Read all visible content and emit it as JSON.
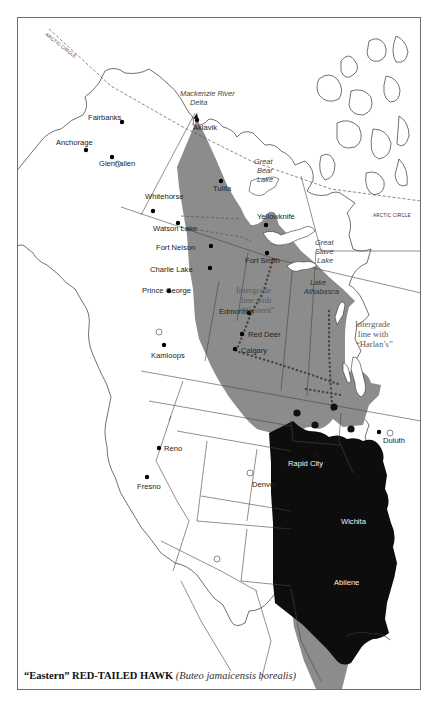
{
  "caption": {
    "common_name": "“Eastern” RED-TAILED HAWK",
    "scientific_name": "(Buteo jamaicensis borealis)"
  },
  "colors": {
    "breeding_range": "#8c8c8c",
    "year_round_range": "#0d0d0d",
    "land": "#ffffff",
    "frame": "#6e6e6e"
  },
  "labels": {
    "arctic_circle_nw": "ARCTIC CIRCLE",
    "arctic_circle_e": "ARCTIC CIRCLE",
    "mackenzie_1": "Mackenzie River",
    "mackenzie_2": "Delta",
    "great_bear_1": "Great",
    "great_bear_2": "Bear",
    "great_bear_3": "Lake",
    "great_slave_1": "Great",
    "great_slave_2": "Slave",
    "great_slave_3": "Lake",
    "athabasca_1": "Lake",
    "athabasca_2": "Athabasca",
    "western_1": "Intergrade",
    "western_2": "line with",
    "western_3": "“Western”",
    "harlans_1": "Intergrade",
    "harlans_2": "line with",
    "harlans_3": "“Harlan’s”"
  },
  "cities": [
    {
      "name": "Fairbanks",
      "x": 121,
      "y": 121,
      "lx": 87,
      "ly": 119
    },
    {
      "name": "Anchorage",
      "x": 85,
      "y": 149,
      "lx": 55,
      "ly": 144
    },
    {
      "name": "Glennallen",
      "x": 111,
      "y": 156,
      "lx": 98,
      "ly": 165
    },
    {
      "name": "Aklavik",
      "x": 196,
      "y": 119,
      "lx": 192,
      "ly": 129
    },
    {
      "name": "Tulita",
      "x": 220,
      "y": 180,
      "lx": 212,
      "ly": 190
    },
    {
      "name": "Whitehorse",
      "x": 152,
      "y": 210,
      "lx": 144,
      "ly": 198
    },
    {
      "name": "Watson Lake",
      "x": 177,
      "y": 222,
      "lx": 152,
      "ly": 230
    },
    {
      "name": "Yellowknife",
      "x": 265,
      "y": 224,
      "lx": 256,
      "ly": 218
    },
    {
      "name": "Fort Nelson",
      "x": 210,
      "y": 245,
      "lx": 155,
      "ly": 249
    },
    {
      "name": "Fort Smith",
      "x": 266,
      "y": 252,
      "lx": 244,
      "ly": 262
    },
    {
      "name": "Charlie Lake",
      "x": 209,
      "y": 267,
      "lx": 149,
      "ly": 271
    },
    {
      "name": "Prince George",
      "x": 168,
      "y": 290,
      "lx": 141,
      "ly": 292
    },
    {
      "name": "Edmonton",
      "x": 248,
      "y": 312,
      "lx": 218,
      "ly": 313
    },
    {
      "name": "Red Deer",
      "x": 241,
      "y": 333,
      "lx": 247,
      "ly": 336
    },
    {
      "name": "Calgary",
      "x": 234,
      "y": 348,
      "lx": 240,
      "ly": 352
    },
    {
      "name": "Kamloops",
      "x": 163,
      "y": 344,
      "lx": 150,
      "ly": 357
    },
    {
      "name": "Duluth",
      "x": 378,
      "y": 431,
      "lx": 382,
      "ly": 442
    },
    {
      "name": "Reno",
      "x": 158,
      "y": 447,
      "lx": 163,
      "ly": 450
    },
    {
      "name": "Fresno",
      "x": 146,
      "y": 476,
      "lx": 136,
      "ly": 488
    },
    {
      "name": "Denver",
      "x": 0,
      "y": 0,
      "lx": 251,
      "ly": 486,
      "no_dot": true
    },
    {
      "name": "Rapid City",
      "x": 0,
      "y": 0,
      "lx": 287,
      "ly": 465,
      "no_dot": true,
      "white": true
    },
    {
      "name": "Wichita",
      "x": 0,
      "y": 0,
      "lx": 340,
      "ly": 523,
      "no_dot": true,
      "white": true
    },
    {
      "name": "Abilene",
      "x": 0,
      "y": 0,
      "lx": 333,
      "ly": 584,
      "no_dot": true,
      "white": true
    }
  ],
  "large_dots": [
    {
      "x": 296,
      "y": 412
    },
    {
      "x": 333,
      "y": 406
    },
    {
      "x": 314,
      "y": 424
    },
    {
      "x": 350,
      "y": 428
    },
    {
      "x": 315,
      "y": 453
    }
  ],
  "open_circles": [
    {
      "x": 117,
      "y": 163
    },
    {
      "x": 158,
      "y": 331
    },
    {
      "x": 249,
      "y": 472
    },
    {
      "x": 216,
      "y": 558
    },
    {
      "x": 389,
      "y": 432
    }
  ]
}
